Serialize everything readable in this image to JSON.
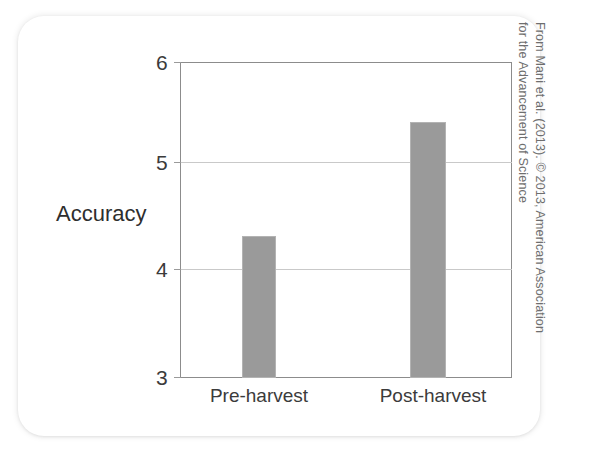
{
  "figure": {
    "credit_line_1": "From Mani et al. (2013). © 2013, American Association",
    "credit_line_2": "for the Advancement of Science"
  },
  "chart_data": {
    "type": "bar",
    "title": "",
    "subtitle": "",
    "xlabel": "",
    "ylabel": "Accuracy",
    "categories": [
      "Pre-harvest",
      "Post-harvest"
    ],
    "values": [
      4.35,
      5.43
    ],
    "ylim": [
      3,
      6
    ],
    "yticks": [
      3,
      4,
      5,
      6
    ],
    "ytick_labels": [
      "3",
      "4",
      "5",
      "6"
    ],
    "grid": "horizontal gridlines at 4 and 5",
    "legend": "none",
    "bar_color": "#9a9a9a",
    "axis_color": "#8c8c8c",
    "gridline_color": "#c9c9c9",
    "bars": [
      {
        "label": "Pre-harvest",
        "value": 4.35
      },
      {
        "label": "Post-harvest",
        "value": 5.43
      }
    ]
  }
}
